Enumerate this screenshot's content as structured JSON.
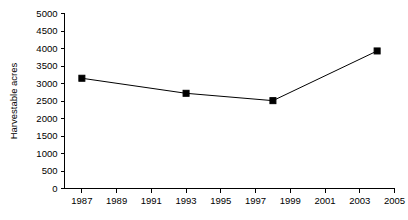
{
  "chart_data": {
    "type": "line",
    "title": "",
    "subtitle": "",
    "xlabel": "",
    "ylabel": "Harvestable acres",
    "x": [
      1987,
      1993,
      1998,
      2004
    ],
    "values": [
      3150,
      2720,
      2510,
      3930
    ],
    "series": [
      {
        "name": "Harvestable acres",
        "x": [
          1987,
          1993,
          1998,
          2004
        ],
        "values": [
          3150,
          2720,
          2510,
          3930
        ]
      }
    ],
    "xlim": [
      1986,
      2005
    ],
    "ylim": [
      0,
      5000
    ],
    "xticks": [
      1987,
      1989,
      1991,
      1993,
      1995,
      1997,
      1999,
      2001,
      2003,
      2005
    ],
    "xtick_labels": [
      "1987",
      "1989",
      "1991",
      "1993",
      "1995",
      "1997",
      "1999",
      "2001",
      "2003",
      "2005"
    ],
    "yticks": [
      0,
      500,
      1000,
      1500,
      2000,
      2500,
      3000,
      3500,
      4000,
      4500,
      5000
    ],
    "ytick_labels": [
      "0",
      "500",
      "1000",
      "1500",
      "2000",
      "2500",
      "3000",
      "3500",
      "4000",
      "4500",
      "5000"
    ],
    "grid": false,
    "legend": false,
    "legend_position": "none",
    "annotations": [],
    "marker": "square",
    "line_color": "#000000",
    "marker_color": "#000000",
    "background_color": "#ffffff"
  }
}
